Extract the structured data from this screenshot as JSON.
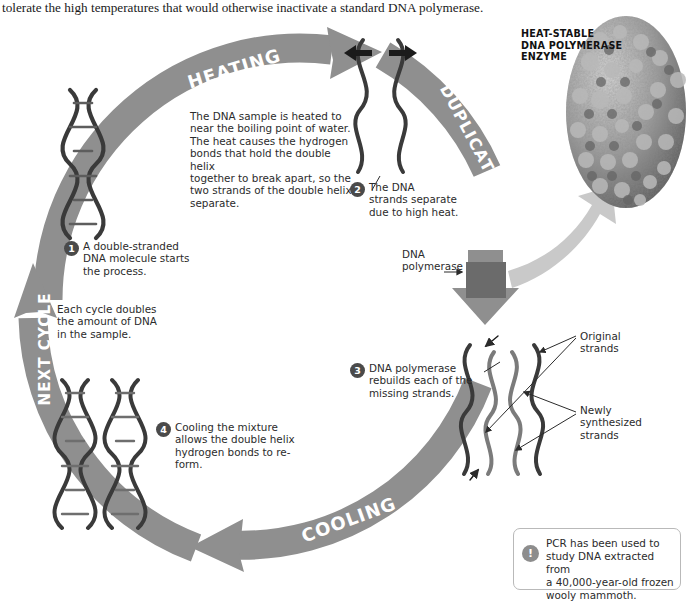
{
  "intro": {
    "text": "tolerate the high temperatures that would otherwise inactivate a standard DNA polymerase."
  },
  "diagram": {
    "arc_labels": {
      "heating": "HEATING",
      "duplication": "DUPLICATION",
      "cooling": "COOLING",
      "next_cycle": "NEXT CYCLE"
    },
    "colors": {
      "arrow_gray": "#8f8f8f",
      "arrow_gray_dark": "#7d7d7d",
      "helix_dark": "#3a3a3a",
      "helix_mid": "#6e6e6e",
      "callout_badge": "#4a4a4a",
      "fact_icon": "#8d8d8d",
      "text": "#2b2b2b"
    }
  },
  "heating_description": {
    "lines": [
      "The DNA sample is heated to",
      "near the boiling point of water.",
      "The heat causes the hydrogen",
      "bonds that hold the double helix",
      "together to break apart, so the",
      "two strands of the double helix",
      "separate."
    ]
  },
  "cycle_note": {
    "lines": [
      "Each cycle doubles",
      "the amount of DNA",
      "in the sample."
    ]
  },
  "callouts": [
    {
      "number": "1",
      "lines": [
        "A double-stranded",
        "DNA molecule starts",
        "the process."
      ]
    },
    {
      "number": "2",
      "lines": [
        "The DNA",
        "strands separate",
        "due to high heat."
      ]
    },
    {
      "number": "3",
      "lines": [
        "DNA polymerase",
        "rebuilds each of the",
        "missing strands."
      ]
    },
    {
      "number": "4",
      "lines": [
        "Cooling the mixture",
        "allows the double helix",
        "hydrogen bonds to re-form."
      ]
    }
  ],
  "labels": {
    "dna_polymerase": [
      "DNA",
      "polymerase"
    ],
    "original_strands": [
      "Original",
      "strands"
    ],
    "newly_synthesized_strands": [
      "Newly",
      "synthesized",
      "strands"
    ]
  },
  "enzyme_caption": {
    "lines": [
      "HEAT-STABLE",
      "DNA POLYMERASE",
      "ENZYME"
    ]
  },
  "fact_box": {
    "icon": "exclamation-icon",
    "icon_glyph": "!",
    "lines": [
      "PCR has been used to",
      "study DNA extracted from",
      "a 40,000-year-old frozen",
      "wooly mammoth."
    ]
  }
}
